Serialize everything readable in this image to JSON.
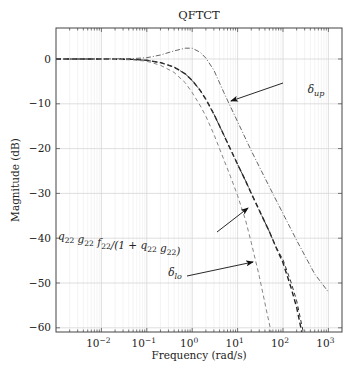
{
  "chart_data": {
    "type": "line",
    "title": "QFTCT",
    "xlabel": "Frequency (rad/s)",
    "ylabel": "Magnitude (dB)",
    "xscale": "log",
    "xlim": [
      0.001,
      2000
    ],
    "ylim": [
      -61,
      7
    ],
    "grid": true,
    "xticks": [
      0.01,
      0.1,
      1,
      10,
      100,
      1000
    ],
    "xtick_labels": [
      [
        "10",
        "−2"
      ],
      [
        "10",
        "−1"
      ],
      [
        "10",
        "0"
      ],
      [
        "10",
        "1"
      ],
      [
        "10",
        "2"
      ],
      [
        "10",
        "3"
      ]
    ],
    "yticks": [
      0,
      -10,
      -20,
      -30,
      -40,
      -50,
      -60
    ],
    "ytick_labels": [
      "0",
      "−10",
      "−20",
      "−30",
      "−40",
      "−50",
      "−60"
    ],
    "series": [
      {
        "name": "δ_up",
        "style": "dashdot",
        "color": "#555555",
        "width": 0.9,
        "x": [
          0.001,
          0.01,
          0.05,
          0.1,
          0.2,
          0.4,
          0.7,
          1,
          1.5,
          2,
          3,
          5,
          7,
          10,
          20,
          50,
          100,
          200,
          500,
          1000
        ],
        "y": [
          0,
          0,
          0.1,
          0.3,
          0.9,
          1.8,
          2.4,
          2.4,
          1.5,
          0.2,
          -2.5,
          -7.5,
          -10.7,
          -14,
          -20.5,
          -28.5,
          -34.5,
          -40.5,
          -48,
          -52
        ]
      },
      {
        "name": "q22 g22 f22/(1+q22 g22)",
        "style": "dashed",
        "color": "#222222",
        "width": 1.4,
        "x": [
          0.001,
          0.01,
          0.05,
          0.1,
          0.2,
          0.4,
          0.7,
          1,
          1.5,
          2,
          3,
          5,
          7,
          10,
          15,
          20,
          30,
          50,
          70,
          100,
          150,
          200,
          260
        ],
        "y": [
          0,
          0,
          -0.1,
          -0.3,
          -0.8,
          -1.8,
          -3.3,
          -4.8,
          -7,
          -9,
          -12.3,
          -17,
          -20.2,
          -23.5,
          -27.2,
          -30,
          -33.8,
          -38.5,
          -42,
          -45.5,
          -51,
          -55.5,
          -61
        ]
      },
      {
        "name": "q22 g22 f22/(1+q22 g22) (variant)",
        "style": "dashed",
        "color": "#333333",
        "width": 1.0,
        "x": [
          0.001,
          0.01,
          0.05,
          0.1,
          0.2,
          0.4,
          0.7,
          1,
          1.5,
          2,
          3,
          5,
          7,
          10,
          15,
          20,
          30,
          50,
          70,
          100,
          150,
          200,
          280
        ],
        "y": [
          0,
          0,
          -0.1,
          -0.3,
          -0.8,
          -1.8,
          -3.3,
          -4.8,
          -7,
          -9,
          -12.3,
          -17,
          -20.2,
          -23.5,
          -27.2,
          -30,
          -33.8,
          -38.5,
          -42,
          -44.8,
          -49.8,
          -54,
          -61
        ]
      },
      {
        "name": "δ_lo",
        "style": "dashed",
        "color": "#777777",
        "width": 0.9,
        "x": [
          0.001,
          0.01,
          0.05,
          0.1,
          0.2,
          0.4,
          0.7,
          1,
          1.5,
          2,
          3,
          5,
          7,
          10,
          15,
          20,
          30,
          45,
          55
        ],
        "y": [
          0,
          0,
          -0.2,
          -0.5,
          -1.4,
          -3,
          -5.3,
          -7.5,
          -10.4,
          -12.8,
          -16.8,
          -22.5,
          -26.3,
          -30.5,
          -36,
          -41,
          -48.5,
          -57,
          -61
        ]
      }
    ],
    "annotations": [
      {
        "text": "δup",
        "base": "δ",
        "sub": "up",
        "label_xy": [
          316,
          93
        ],
        "arrow_from": [
          283,
          83
        ],
        "arrow_to": [
          231,
          101
        ]
      },
      {
        "text": "q22 g22 f22/(1 + q22 g22)",
        "label_xy": [
          120,
          240
        ],
        "arrow_from": [
          217,
          232
        ],
        "arrow_to": [
          248,
          208
        ]
      },
      {
        "text": "δlo",
        "base": "δ",
        "sub": "lo",
        "label_xy": [
          175,
          276
        ],
        "arrow_from": [
          187,
          276
        ],
        "arrow_to": [
          253,
          262
        ]
      }
    ]
  }
}
